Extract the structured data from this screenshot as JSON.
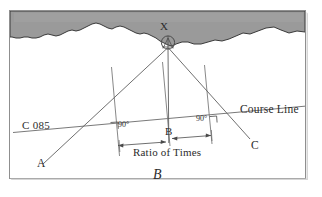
{
  "figure": {
    "caption": "B",
    "type": "navigation-plotting-diagram",
    "frame": {
      "border_color": "#8a8a8a"
    },
    "landmass": {
      "fill_color": "#9a9a9a",
      "outline_color": "#3a3a3a",
      "name": "shoreline-landmass"
    },
    "labels": {
      "station_x": "X",
      "course_label": "C 085",
      "course_line": "Course Line",
      "point_a": "A",
      "point_b": "B",
      "point_c": "C",
      "angle_left": "90°",
      "angle_right": "90°",
      "ratio_of_times": "Ratio of Times"
    },
    "icons": {
      "beacon": "survey-beacon-icon"
    },
    "geometry": {
      "station": {
        "x": 168,
        "y": 46
      },
      "bearing_lines": [
        {
          "name": "bearing-to-a",
          "from": [
            168,
            46
          ],
          "to": [
            44,
            163
          ]
        },
        {
          "name": "bearing-to-b",
          "from": [
            168,
            46
          ],
          "to": [
            168,
            143
          ]
        },
        {
          "name": "bearing-to-c",
          "from": [
            168,
            46
          ],
          "to": [
            249,
            138
          ]
        }
      ],
      "course_line": {
        "from": [
          16,
          132
        ],
        "to": [
          305,
          106
        ]
      },
      "perpendiculars": [
        {
          "name": "perpendicular-left",
          "from": [
            112,
            68
          ],
          "to": [
            119,
            155
          ]
        },
        {
          "name": "perpendicular-middle",
          "from": [
            163,
            63
          ],
          "to": [
            170,
            145
          ]
        },
        {
          "name": "perpendicular-right",
          "from": [
            205,
            66
          ],
          "to": [
            212,
            143
          ]
        }
      ],
      "dimension_segments": [
        {
          "name": "ratio-segment-left",
          "from": [
            116,
            146
          ],
          "to": [
            167,
            142
          ]
        },
        {
          "name": "ratio-segment-right",
          "from": [
            169,
            136
          ],
          "to": [
            211,
            132
          ]
        }
      ]
    },
    "colors": {
      "line": "#555555",
      "text": "#2c2c2c",
      "background": "#ffffff"
    }
  }
}
